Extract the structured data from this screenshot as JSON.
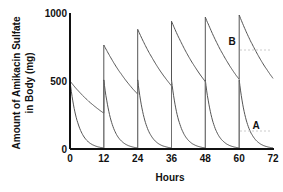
{
  "chart_data": {
    "type": "line",
    "title": "",
    "xlabel": "Hours",
    "ylabel": [
      "Amount of Amikacin Sulfate",
      "in Body (mg)"
    ],
    "xlim": [
      0,
      72
    ],
    "ylim": [
      0,
      1000
    ],
    "x_ticks": [
      0,
      12,
      24,
      36,
      48,
      60,
      72
    ],
    "y_ticks": [
      0,
      500,
      1000
    ],
    "grid": false,
    "legend": "inline labels",
    "dose_mg": 500,
    "dose_interval_h": 12,
    "series": [
      {
        "name": "A",
        "description": "Rapid elimination; each 500 mg dose decays to ~0 before next dose",
        "half_life_h": 2,
        "points": [
          {
            "x": 0,
            "y": 500
          },
          {
            "x": 12,
            "y": 8
          },
          {
            "x": 12,
            "y": 508
          },
          {
            "x": 24,
            "y": 8
          },
          {
            "x": 24,
            "y": 508
          },
          {
            "x": 36,
            "y": 8
          },
          {
            "x": 36,
            "y": 508
          },
          {
            "x": 48,
            "y": 8
          },
          {
            "x": 48,
            "y": 508
          },
          {
            "x": 60,
            "y": 8
          },
          {
            "x": 60,
            "y": 508
          },
          {
            "x": 72,
            "y": 8
          }
        ],
        "label_position": {
          "x": 65,
          "y": 130
        }
      },
      {
        "name": "B",
        "description": "Slow elimination; drug accumulates toward steady state",
        "half_life_h": 13,
        "points": [
          {
            "x": 0,
            "y": 500
          },
          {
            "x": 12,
            "y": 265
          },
          {
            "x": 12,
            "y": 765
          },
          {
            "x": 24,
            "y": 380
          },
          {
            "x": 24,
            "y": 880
          },
          {
            "x": 36,
            "y": 440
          },
          {
            "x": 36,
            "y": 940
          },
          {
            "x": 48,
            "y": 470
          },
          {
            "x": 48,
            "y": 970
          },
          {
            "x": 60,
            "y": 485
          },
          {
            "x": 60,
            "y": 985
          },
          {
            "x": 72,
            "y": 495
          }
        ],
        "label_position": {
          "x": 65,
          "y": 720
        }
      }
    ],
    "annotations": [
      {
        "text": "A",
        "x": 65,
        "y": 180
      },
      {
        "text": "B",
        "x": 65,
        "y": 800
      }
    ]
  },
  "labels": {
    "xlabel": "Hours",
    "ylabel_line1": "Amount of Amikacin Sulfate",
    "ylabel_line2": "in Body (mg)",
    "series_a": "A",
    "series_b": "B"
  }
}
